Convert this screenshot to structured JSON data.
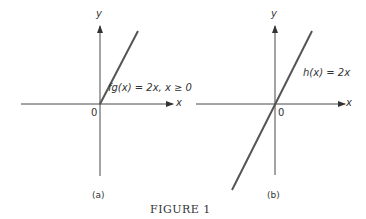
{
  "figure": {
    "caption": "FIGURE 1",
    "panels": [
      {
        "id": "a",
        "label": "(a)",
        "x_axis_label": "x",
        "y_axis_label": "y",
        "origin_label": "0",
        "function_label": "fg(x) = 2x, x ≥ 0",
        "function": "2x",
        "domain": "x >= 0"
      },
      {
        "id": "b",
        "label": "(b)",
        "x_axis_label": "x",
        "y_axis_label": "y",
        "origin_label": "0",
        "function_label": "h(x) = 2x",
        "function": "2x",
        "domain": "all real x"
      }
    ]
  },
  "colors": {
    "axis": "#333333",
    "graph_line": "#555555",
    "text": "#333333"
  }
}
